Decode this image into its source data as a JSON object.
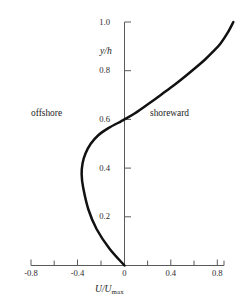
{
  "figure": {
    "clipped_top_text": "· · · · · · ·",
    "background_color": "#ffffff",
    "curve_color": "#111111",
    "axis_color": "#5a5a5a"
  },
  "chart_data": {
    "type": "line",
    "title": "",
    "subtitle": "",
    "xlabel": "U/Umax",
    "xlabel_main": "U/U",
    "xlabel_sub": "max",
    "ylabel": "y/h",
    "xlim": [
      -0.9,
      1.0
    ],
    "ylim": [
      0.0,
      1.0
    ],
    "grid": false,
    "legend": "none",
    "x_major_ticks": [
      -0.8,
      -0.4,
      0,
      0.4,
      0.8
    ],
    "x_major_tick_labels": [
      "-0.8",
      "-0.4",
      "0",
      "0.4",
      "0.8"
    ],
    "x_minor_ticks": [
      -0.6,
      -0.2,
      0.2,
      0.6,
      1.0
    ],
    "y_major_ticks": [
      0.2,
      0.4,
      0.6,
      0.8,
      1.0
    ],
    "y_major_tick_labels": [
      "0.2",
      "0.4",
      "0.6",
      "0.8",
      "1.0"
    ],
    "series": [
      {
        "name": "undertow velocity profile",
        "x": [
          0.0,
          -0.13,
          -0.24,
          -0.31,
          -0.355,
          -0.368,
          -0.36,
          -0.335,
          -0.29,
          -0.225,
          -0.135,
          -0.03,
          0.0,
          0.09,
          0.21,
          0.325,
          0.43,
          0.525,
          0.61,
          0.69,
          0.76,
          0.825,
          0.885,
          0.935
        ],
        "y": [
          0.0,
          0.07,
          0.15,
          0.23,
          0.32,
          0.375,
          0.42,
          0.46,
          0.5,
          0.535,
          0.565,
          0.592,
          0.6,
          0.625,
          0.665,
          0.705,
          0.742,
          0.778,
          0.812,
          0.845,
          0.878,
          0.912,
          0.955,
          1.0
        ]
      }
    ],
    "annotations": [
      {
        "text": "offshore",
        "x": -0.55,
        "y": 0.735
      },
      {
        "text": "shoreward",
        "x": 0.44,
        "y": 0.735
      }
    ]
  }
}
